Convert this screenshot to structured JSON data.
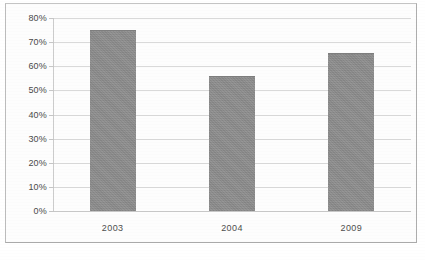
{
  "chart_data": {
    "type": "bar",
    "title": "",
    "subtitle": "",
    "xlabel": "",
    "ylabel": "",
    "categories": [
      "2003",
      "2004",
      "2009"
    ],
    "values": [
      75,
      56,
      65.5
    ],
    "value_labels": [
      "75%",
      "56%",
      "65.5%"
    ],
    "series": [
      {
        "name": "",
        "values": [
          75,
          56,
          65.5
        ]
      }
    ],
    "ylim": [
      0,
      80
    ],
    "ytick_step": 10,
    "ytick_labels": [
      "0%",
      "10%",
      "20%",
      "30%",
      "40%",
      "50%",
      "60%",
      "70%",
      "80%"
    ],
    "ytick_values": [
      0,
      10,
      20,
      30,
      40,
      50,
      60,
      70,
      80
    ],
    "grid": true,
    "grid_axis": "y",
    "legend": false,
    "legend_position": "none",
    "bar_color": "#8d8d8d",
    "gridline_color": "#d9d9d9",
    "axis_color": "#cccccc",
    "background_color": "#fdfdfd",
    "frame_color": "#b9b9b9",
    "text_color": "#4a4a4a"
  },
  "figure": {
    "caption": "",
    "caption_note": "clipped"
  }
}
